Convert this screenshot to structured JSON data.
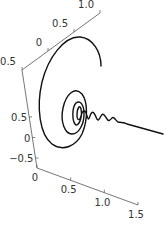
{
  "chart_data": {
    "type": "line",
    "title": "",
    "projection": "3d",
    "axes": {
      "x": {
        "label": "",
        "range": [
          0,
          1.5
        ],
        "ticks": [
          0,
          0.5,
          1.0,
          1.5
        ],
        "tick_labels": [
          "0",
          "0.5",
          "1.0",
          "1.5"
        ]
      },
      "y": {
        "label": "",
        "range": [
          -0.5,
          1.0
        ],
        "ticks": [
          -0.5,
          0,
          0.5,
          1.0
        ],
        "tick_labels": [
          "−0.5",
          "0",
          "0.5",
          "1.0"
        ]
      },
      "z": {
        "label": "",
        "range": [
          -0.5,
          0.5
        ],
        "ticks": [
          0.5,
          0,
          -0.5
        ],
        "tick_labels": [
          "0.5",
          "0",
          "−0.5"
        ]
      }
    },
    "series": [
      {
        "name": "spiral",
        "color": "#111111",
        "x_start": 0,
        "x_end": 1.5,
        "y_amplitude_start": 0.9,
        "z_amplitude_start": 0.6,
        "turns": 7,
        "decay": "exponential"
      }
    ],
    "grid": false,
    "legend": "none"
  }
}
